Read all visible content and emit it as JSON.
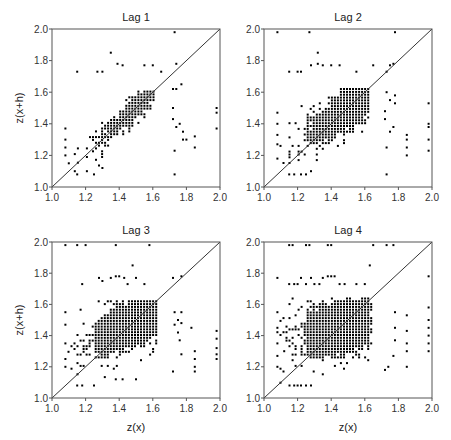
{
  "chart_data": [
    {
      "type": "scatter",
      "title": "Lag 1",
      "xlabel": "",
      "ylabel": "z(x+h)",
      "xlim": [
        1.0,
        2.0
      ],
      "ylim": [
        1.0,
        2.0
      ],
      "xticks": [
        "1.0",
        "1.2",
        "1.4",
        "1.6",
        "1.8",
        "2.0"
      ],
      "yticks": [
        "1.0",
        "1.2",
        "1.4",
        "1.6",
        "1.8",
        "2.0"
      ],
      "reference_line": "y = x",
      "grid": false,
      "dense_cloud": {
        "x_range": [
          1.1,
          1.62
        ],
        "y_range": [
          1.1,
          1.62
        ],
        "center": [
          1.5,
          1.5
        ],
        "correlation": "strong positive"
      },
      "outliers": [
        [
          1.35,
          1.85
        ],
        [
          1.73,
          1.98
        ],
        [
          1.15,
          1.73
        ],
        [
          1.98,
          1.5
        ],
        [
          1.98,
          1.47
        ],
        [
          1.98,
          1.37
        ],
        [
          1.85,
          1.32
        ],
        [
          1.85,
          1.25
        ],
        [
          1.73,
          1.08
        ],
        [
          1.73,
          1.23
        ],
        [
          1.78,
          1.3
        ],
        [
          1.8,
          1.3
        ],
        [
          1.74,
          1.78
        ],
        [
          1.77,
          1.65
        ],
        [
          1.72,
          1.62
        ],
        [
          1.74,
          1.62
        ],
        [
          1.72,
          1.5
        ],
        [
          1.72,
          1.43
        ],
        [
          1.74,
          1.38
        ],
        [
          1.78,
          1.35
        ],
        [
          1.76,
          1.4
        ],
        [
          1.08,
          1.37
        ],
        [
          1.08,
          1.3
        ],
        [
          1.08,
          1.25
        ],
        [
          1.08,
          1.2
        ],
        [
          1.1,
          1.15
        ],
        [
          1.15,
          1.08
        ],
        [
          1.25,
          1.08
        ],
        [
          1.3,
          1.12
        ],
        [
          1.27,
          1.73
        ],
        [
          1.3,
          1.73
        ],
        [
          1.39,
          1.78
        ],
        [
          1.42,
          1.77
        ],
        [
          1.55,
          1.77
        ],
        [
          1.6,
          1.77
        ],
        [
          1.65,
          1.73
        ]
      ]
    },
    {
      "type": "scatter",
      "title": "Lag 2",
      "xlabel": "",
      "ylabel": "",
      "xlim": [
        1.0,
        2.0
      ],
      "ylim": [
        1.0,
        2.0
      ],
      "xticks": [
        "1.0",
        "1.2",
        "1.4",
        "1.6",
        "1.8",
        "2.0"
      ],
      "yticks": [
        "1.0",
        "1.2",
        "1.4",
        "1.6",
        "1.8",
        "2.0"
      ],
      "reference_line": "y = x",
      "grid": false,
      "dense_cloud": {
        "x_range": [
          1.08,
          1.63
        ],
        "y_range": [
          1.08,
          1.63
        ],
        "center": [
          1.48,
          1.48
        ],
        "correlation": "moderate positive"
      },
      "outliers": [
        [
          1.08,
          1.98
        ],
        [
          1.27,
          1.98
        ],
        [
          1.78,
          1.98
        ],
        [
          1.32,
          1.85
        ],
        [
          1.15,
          1.73
        ],
        [
          1.2,
          1.73
        ],
        [
          1.22,
          1.73
        ],
        [
          1.28,
          1.77
        ],
        [
          1.32,
          1.78
        ],
        [
          1.35,
          1.77
        ],
        [
          1.4,
          1.77
        ],
        [
          1.45,
          1.77
        ],
        [
          1.55,
          1.73
        ],
        [
          1.65,
          1.77
        ],
        [
          1.75,
          1.77
        ],
        [
          1.77,
          1.78
        ],
        [
          1.73,
          1.73
        ],
        [
          1.98,
          1.53
        ],
        [
          1.98,
          1.4
        ],
        [
          1.98,
          1.38
        ],
        [
          1.98,
          1.3
        ],
        [
          1.98,
          1.23
        ],
        [
          1.85,
          1.33
        ],
        [
          1.85,
          1.3
        ],
        [
          1.85,
          1.25
        ],
        [
          1.85,
          1.2
        ],
        [
          1.73,
          1.08
        ],
        [
          1.73,
          1.25
        ],
        [
          1.75,
          1.35
        ],
        [
          1.77,
          1.38
        ],
        [
          1.73,
          1.6
        ],
        [
          1.75,
          1.55
        ],
        [
          1.78,
          1.58
        ],
        [
          1.78,
          1.53
        ],
        [
          1.72,
          1.48
        ],
        [
          1.72,
          1.43
        ],
        [
          1.08,
          1.47
        ],
        [
          1.08,
          1.4
        ],
        [
          1.08,
          1.33
        ],
        [
          1.08,
          1.27
        ],
        [
          1.08,
          1.18
        ],
        [
          1.15,
          1.08
        ],
        [
          1.18,
          1.08
        ],
        [
          1.22,
          1.08
        ],
        [
          1.25,
          1.08
        ],
        [
          1.28,
          1.1
        ]
      ]
    },
    {
      "type": "scatter",
      "title": "Lag 3",
      "xlabel": "z(x)",
      "ylabel": "z(x+h)",
      "xlim": [
        1.0,
        2.0
      ],
      "ylim": [
        1.0,
        2.0
      ],
      "xticks": [
        "1.0",
        "1.2",
        "1.4",
        "1.6",
        "1.8",
        "2.0"
      ],
      "yticks": [
        "1.0",
        "1.2",
        "1.4",
        "1.6",
        "1.8",
        "2.0"
      ],
      "reference_line": "y = x",
      "grid": false,
      "dense_cloud": {
        "x_range": [
          1.08,
          1.63
        ],
        "y_range": [
          1.08,
          1.63
        ],
        "center": [
          1.47,
          1.47
        ],
        "correlation": "weak positive"
      },
      "outliers": [
        [
          1.08,
          1.98
        ],
        [
          1.15,
          1.98
        ],
        [
          1.2,
          1.98
        ],
        [
          1.38,
          1.98
        ],
        [
          1.58,
          1.98
        ],
        [
          1.48,
          1.85
        ],
        [
          1.18,
          1.73
        ],
        [
          1.28,
          1.77
        ],
        [
          1.3,
          1.75
        ],
        [
          1.35,
          1.77
        ],
        [
          1.38,
          1.78
        ],
        [
          1.4,
          1.78
        ],
        [
          1.43,
          1.77
        ],
        [
          1.45,
          1.73
        ],
        [
          1.5,
          1.77
        ],
        [
          1.55,
          1.73
        ],
        [
          1.72,
          1.77
        ],
        [
          1.77,
          1.78
        ],
        [
          1.98,
          1.43
        ],
        [
          1.98,
          1.38
        ],
        [
          1.98,
          1.32
        ],
        [
          1.98,
          1.28
        ],
        [
          1.98,
          1.25
        ],
        [
          1.85,
          1.3
        ],
        [
          1.85,
          1.25
        ],
        [
          1.85,
          1.2
        ],
        [
          1.85,
          1.17
        ],
        [
          1.83,
          1.45
        ],
        [
          1.72,
          1.17
        ],
        [
          1.73,
          1.55
        ],
        [
          1.75,
          1.5
        ],
        [
          1.77,
          1.55
        ],
        [
          1.73,
          1.47
        ],
        [
          1.75,
          1.42
        ],
        [
          1.77,
          1.48
        ],
        [
          1.76,
          1.37
        ],
        [
          1.77,
          1.28
        ],
        [
          1.08,
          1.55
        ],
        [
          1.08,
          1.47
        ],
        [
          1.08,
          1.35
        ],
        [
          1.08,
          1.25
        ],
        [
          1.08,
          1.2
        ],
        [
          1.15,
          1.08
        ],
        [
          1.18,
          1.08
        ],
        [
          1.25,
          1.08
        ],
        [
          1.5,
          1.12
        ],
        [
          1.42,
          1.12
        ],
        [
          1.38,
          1.12
        ]
      ]
    },
    {
      "type": "scatter",
      "title": "Lag 4",
      "xlabel": "z(x)",
      "ylabel": "",
      "xlim": [
        1.0,
        2.0
      ],
      "ylim": [
        1.0,
        2.0
      ],
      "xticks": [
        "1.0",
        "1.2",
        "1.4",
        "1.6",
        "1.8",
        "2.0"
      ],
      "yticks": [
        "1.0",
        "1.2",
        "1.4",
        "1.6",
        "1.8",
        "2.0"
      ],
      "reference_line": "y = x",
      "grid": false,
      "dense_cloud": {
        "x_range": [
          1.08,
          1.65
        ],
        "y_range": [
          1.08,
          1.65
        ],
        "center": [
          1.46,
          1.46
        ],
        "correlation": "weak positive"
      },
      "outliers": [
        [
          1.15,
          1.98
        ],
        [
          1.17,
          1.98
        ],
        [
          1.25,
          1.98
        ],
        [
          1.27,
          1.98
        ],
        [
          1.38,
          1.98
        ],
        [
          1.4,
          1.98
        ],
        [
          1.65,
          1.98
        ],
        [
          1.73,
          1.98
        ],
        [
          1.77,
          1.98
        ],
        [
          1.63,
          1.85
        ],
        [
          1.08,
          1.77
        ],
        [
          1.15,
          1.73
        ],
        [
          1.18,
          1.73
        ],
        [
          1.2,
          1.73
        ],
        [
          1.22,
          1.77
        ],
        [
          1.25,
          1.73
        ],
        [
          1.28,
          1.77
        ],
        [
          1.3,
          1.73
        ],
        [
          1.33,
          1.73
        ],
        [
          1.35,
          1.77
        ],
        [
          1.38,
          1.78
        ],
        [
          1.4,
          1.78
        ],
        [
          1.42,
          1.78
        ],
        [
          1.45,
          1.73
        ],
        [
          1.48,
          1.73
        ],
        [
          1.55,
          1.73
        ],
        [
          1.6,
          1.73
        ],
        [
          1.98,
          1.78
        ],
        [
          1.98,
          1.58
        ],
        [
          1.98,
          1.5
        ],
        [
          1.98,
          1.45
        ],
        [
          1.98,
          1.4
        ],
        [
          1.98,
          1.35
        ],
        [
          1.98,
          1.3
        ],
        [
          1.85,
          1.53
        ],
        [
          1.85,
          1.43
        ],
        [
          1.85,
          1.35
        ],
        [
          1.85,
          1.3
        ],
        [
          1.85,
          1.2
        ],
        [
          1.72,
          1.18
        ],
        [
          1.74,
          1.2
        ],
        [
          1.77,
          1.27
        ],
        [
          1.78,
          1.55
        ],
        [
          1.78,
          1.45
        ],
        [
          1.78,
          1.37
        ],
        [
          1.08,
          1.55
        ],
        [
          1.08,
          1.45
        ],
        [
          1.08,
          1.35
        ],
        [
          1.08,
          1.27
        ],
        [
          1.08,
          1.2
        ],
        [
          1.12,
          1.3
        ],
        [
          1.18,
          1.08
        ],
        [
          1.2,
          1.08
        ],
        [
          1.22,
          1.08
        ],
        [
          1.25,
          1.08
        ],
        [
          1.28,
          1.08
        ]
      ]
    }
  ],
  "panels": [
    {
      "title": "Lag 1",
      "ylabel": "z(x+h)",
      "xlabel": ""
    },
    {
      "title": "Lag 2",
      "ylabel": "",
      "xlabel": ""
    },
    {
      "title": "Lag 3",
      "ylabel": "z(x+h)",
      "xlabel": "z(x)"
    },
    {
      "title": "Lag 4",
      "ylabel": "",
      "xlabel": "z(x)"
    }
  ],
  "ticks": [
    "1.0",
    "1.2",
    "1.4",
    "1.6",
    "1.8",
    "2.0"
  ],
  "colors": {
    "points": "#000000",
    "frame": "#555555",
    "diagonal": "#333333",
    "background": "#ffffff"
  }
}
